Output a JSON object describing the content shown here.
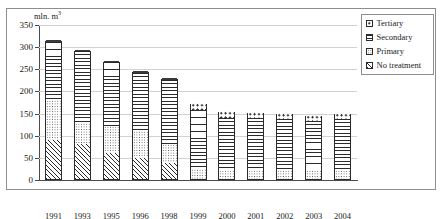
{
  "title": "",
  "axis_unit": {
    "text": "mln. m",
    "exponent": "3"
  },
  "legend": {
    "items": [
      {
        "label": "Tertiary",
        "pattern": "tertiary"
      },
      {
        "label": "Secondary",
        "pattern": "secondary"
      },
      {
        "label": "Primary",
        "pattern": "primary"
      },
      {
        "label": "No treatment",
        "pattern": "notreatment"
      }
    ]
  },
  "chart_data": {
    "type": "bar",
    "stacked": true,
    "title": "",
    "xlabel": "",
    "ylabel": "mln. m3",
    "ylim": [
      0,
      350
    ],
    "yticks": [
      0,
      50,
      100,
      150,
      200,
      250,
      300,
      350
    ],
    "grid": true,
    "legend_position": "top-right",
    "categories": [
      "1991",
      "1993",
      "1995",
      "1996",
      "1998",
      "1999",
      "2000",
      "2001",
      "2002",
      "2003",
      "2004"
    ],
    "series": [
      {
        "name": "No treatment",
        "values": [
          88,
          80,
          58,
          48,
          37,
          0,
          0,
          0,
          0,
          0,
          0
        ]
      },
      {
        "name": "Primary",
        "values": [
          90,
          47,
          62,
          60,
          42,
          22,
          20,
          20,
          20,
          20,
          20
        ]
      },
      {
        "name": "Secondary",
        "values": [
          132,
          163,
          145,
          131,
          144,
          134,
          118,
          118,
          116,
          110,
          115
        ]
      },
      {
        "name": "Tertiary",
        "values": [
          5,
          2,
          2,
          5,
          6,
          16,
          15,
          14,
          14,
          14,
          15
        ]
      }
    ],
    "totals": [
      315,
      292,
      267,
      244,
      229,
      172,
      153,
      152,
      150,
      144,
      150
    ]
  }
}
